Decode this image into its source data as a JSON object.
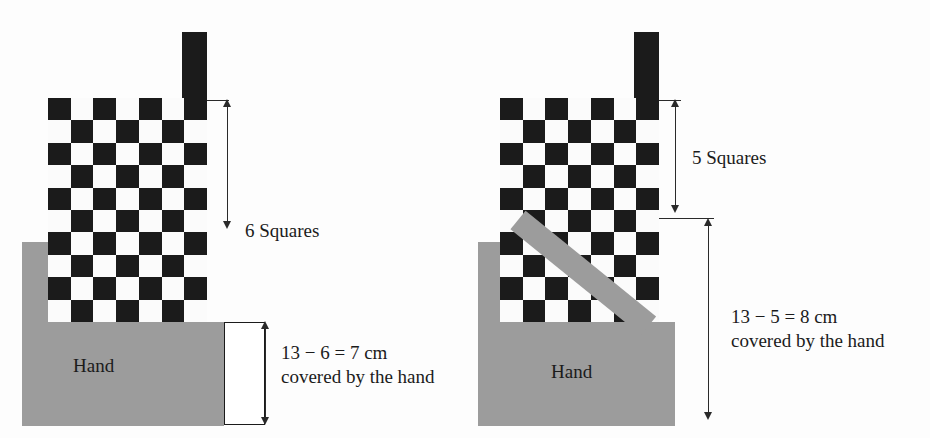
{
  "figure": {
    "title": "",
    "colors": {
      "dark_square": "#1b1b1b",
      "light_square": "#fbfbfb",
      "hand_gray": "#9c9c9c",
      "line": "#2a2a2a",
      "background": "#ffffff"
    }
  },
  "left_panel": {
    "name": "left-diagram",
    "ruler_measure_label": "6 Squares",
    "hand_label": "Hand",
    "covered_caption_line1": "13 − 6 = 7 cm",
    "covered_caption_line2": "covered by the hand",
    "board": {
      "columns": 7,
      "rows": 10,
      "first_cell_dark": true
    },
    "values": {
      "total_cm": 13,
      "visible_squares": 6,
      "covered_cm": 7
    }
  },
  "right_panel": {
    "name": "right-diagram",
    "ruler_measure_label": "5 Squares",
    "hand_label": "Hand",
    "covered_caption_line1": "13 − 5 = 8 cm",
    "covered_caption_line2": "covered by the hand",
    "board": {
      "columns": 7,
      "rows": 10,
      "first_cell_dark": true
    },
    "values": {
      "total_cm": 13,
      "visible_squares": 5,
      "covered_cm": 8
    }
  }
}
